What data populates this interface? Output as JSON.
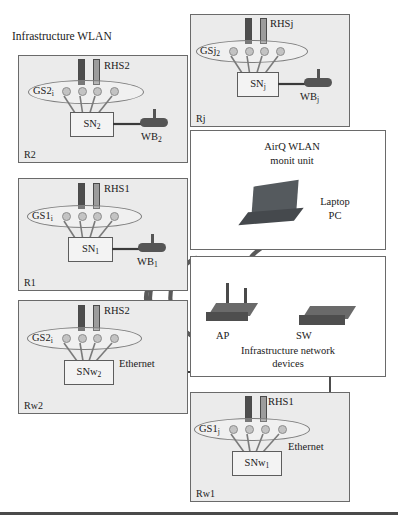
{
  "diagram": {
    "title": "Infrastructure WLAN"
  },
  "rooms": [
    {
      "id": "R2",
      "label": "R2",
      "rhs_label": "RHS2",
      "gs_label": "GS2",
      "gs_sub": "i",
      "sn_label": "SN",
      "sn_sub": "2",
      "wb_label": "WB",
      "wb_sub": "2"
    },
    {
      "id": "Rj",
      "label": "Rj",
      "rhs_label": "RHSj",
      "gs_label": "GSj",
      "gs_sub": "2",
      "sn_label": "SN",
      "sn_sub": "j",
      "wb_label": "WB",
      "wb_sub": "j"
    },
    {
      "id": "R1",
      "label": "R1",
      "rhs_label": "RHS1",
      "gs_label": "GS1",
      "gs_sub": "i",
      "sn_label": "SN",
      "sn_sub": "1",
      "wb_label": "WB",
      "wb_sub": "1"
    },
    {
      "id": "Rw2",
      "label": "Rw2",
      "rhs_label": "RHS2",
      "gs_label": "GS2",
      "gs_sub": "i",
      "sn_label": "SNw",
      "sn_sub": "2",
      "link_label": "Ethernet"
    },
    {
      "id": "Rw1",
      "label": "Rw1",
      "rhs_label": "RHS1",
      "gs_label": "GS1",
      "gs_sub": "j",
      "sn_label": "SNw",
      "sn_sub": "1",
      "link_label": "Ethernet"
    }
  ],
  "monitor_unit": {
    "title_line1": "AirQ WLAN",
    "title_line2": "monit unit",
    "device_line1": "Laptop",
    "device_line2": "PC"
  },
  "network_devices": {
    "ap_label": "AP",
    "sw_label": "SW",
    "caption_line1": "Infrastructure network",
    "caption_line2": "devices"
  },
  "colors": {
    "room_fill": "#ebebeb",
    "room_border": "#6a6a6a",
    "sensor_dark": "#4d4d4d",
    "sensor_light": "#9c9c9c",
    "node_dot": "#c3c3c3",
    "device_dark": "#4e4e4e",
    "wave": "#5a5a5a",
    "line": "#3a3a3a"
  }
}
